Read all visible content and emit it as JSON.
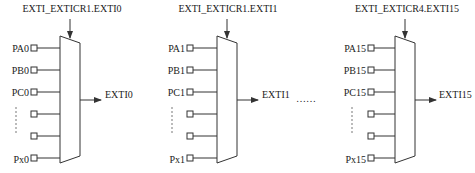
{
  "diagram": {
    "blocks": [
      {
        "select_label": "EXTI_EXTICR1.EXTI0",
        "inputs": [
          "PA0",
          "PB0",
          "PC0",
          "",
          "",
          "Px0"
        ],
        "output": "EXTI0"
      },
      {
        "select_label": "EXTI_EXTICR1.EXTI1",
        "inputs": [
          "PA1",
          "PB1",
          "PC1",
          "",
          "",
          "Px1"
        ],
        "output": "EXTI1"
      },
      {
        "select_label": "EXTI_EXTICR4.EXTI15",
        "inputs": [
          "PA15",
          "PB15",
          "PC15",
          "",
          "",
          "Px15"
        ],
        "output": "EXTI15"
      }
    ],
    "ellipsis_between": "……"
  }
}
